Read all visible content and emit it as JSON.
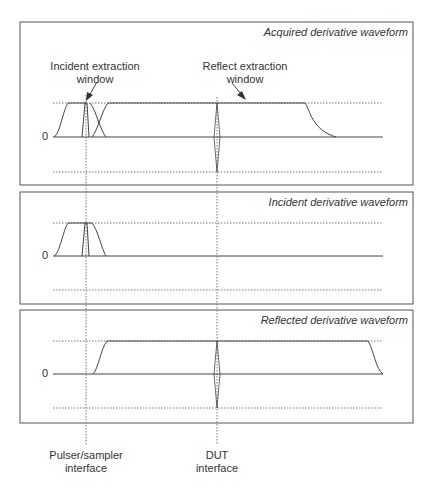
{
  "panels": [
    {
      "title": "Acquired derivative waveform",
      "zero_label": "0"
    },
    {
      "title": "Incident derivative waveform",
      "zero_label": "0"
    },
    {
      "title": "Reflected derivative waveform",
      "zero_label": "0"
    }
  ],
  "annotations": {
    "incident_window": [
      "Incident extraction",
      "window"
    ],
    "reflect_window": [
      "Reflect extraction",
      "window"
    ]
  },
  "markers": {
    "pulser": [
      "Pulser/sampler",
      "interface"
    ],
    "dut": [
      "DUT",
      "interface"
    ]
  },
  "caption": "TDR figure: waveform extraction windows"
}
